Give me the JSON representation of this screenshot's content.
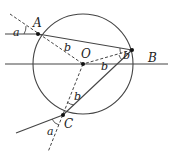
{
  "diagram": {
    "title": "",
    "points": [
      {
        "id": "A",
        "label": "A"
      },
      {
        "id": "B",
        "label": "B"
      },
      {
        "id": "C",
        "label": "C"
      },
      {
        "id": "O",
        "label": "O"
      }
    ],
    "angles": {
      "incident_A": "a",
      "refract_A": "b",
      "reflect_B_upper": "b",
      "reflect_B_lower": "b",
      "refract_C": "b",
      "exit_C": "a"
    }
  }
}
